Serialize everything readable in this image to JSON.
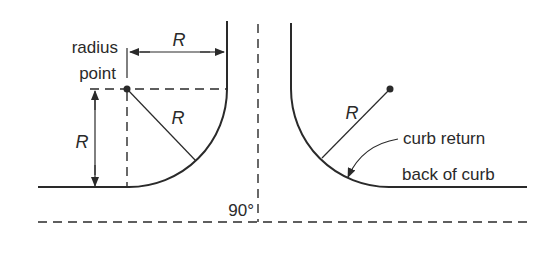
{
  "diagram": {
    "labels": {
      "radius_point_line1": "radius",
      "radius_point_line2": "point",
      "r_top": "R",
      "r_left": "R",
      "r_diag_left": "R",
      "r_diag_right": "R",
      "angle": "90°",
      "curb_return": "curb return",
      "back_of_curb": "back of curb"
    },
    "colors": {
      "line": "#2a2a2a",
      "background": "#ffffff"
    }
  }
}
